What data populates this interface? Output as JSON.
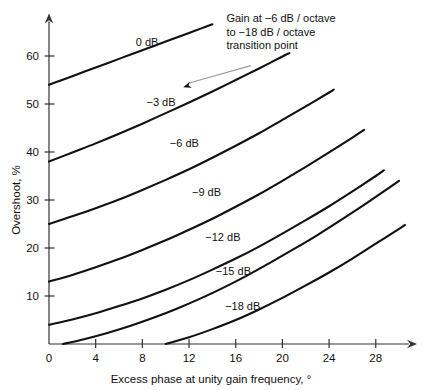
{
  "chart_data": {
    "type": "line",
    "title": "",
    "xlabel": "Excess phase at unity gain frequency, °",
    "ylabel": "Overshoot, %",
    "xlim": [
      0,
      30.5
    ],
    "ylim": [
      0,
      68
    ],
    "grid": false,
    "legend": "inline-curve-labels",
    "xticks": [
      0,
      4,
      8,
      12,
      16,
      20,
      24,
      28
    ],
    "xtick_labels": [
      "0",
      "4",
      "8",
      "12",
      "16",
      "20",
      "24",
      "28"
    ],
    "yticks": [
      10,
      20,
      30,
      40,
      50,
      60
    ],
    "ytick_labels": [
      "10",
      "20",
      "30",
      "40",
      "50",
      "60"
    ],
    "series": [
      {
        "name": "0 dB",
        "label": "0 dB",
        "label_x": 8.4,
        "label_y": 63.0,
        "x": [
          0.0,
          1.0,
          2.0,
          3.0,
          4.0,
          5.0,
          6.0,
          7.0,
          8.0,
          9.0,
          10.0,
          11.0,
          12.0,
          13.0,
          14.0
        ],
        "y": [
          54.0,
          54.9,
          55.8,
          56.7,
          57.6,
          58.5,
          59.4,
          60.3,
          61.2,
          62.1,
          63.0,
          63.9,
          64.8,
          65.7,
          66.6
        ]
      },
      {
        "name": "-3 dB",
        "label": "−3 dB",
        "label_x": 9.6,
        "label_y": 50.5,
        "x": [
          0.0,
          2.0,
          4.0,
          6.0,
          8.0,
          10.0,
          12.0,
          14.0,
          16.0,
          18.0,
          20.0,
          20.6
        ],
        "y": [
          38.0,
          39.9,
          41.8,
          43.8,
          45.9,
          48.1,
          50.3,
          52.6,
          55.0,
          57.4,
          59.9,
          60.6
        ]
      },
      {
        "name": "-6 dB",
        "label": "−6 dB",
        "label_x": 11.6,
        "label_y": 41.8,
        "x": [
          0.0,
          2.0,
          4.0,
          6.0,
          8.0,
          10.0,
          12.0,
          14.0,
          16.0,
          18.0,
          20.0,
          22.0,
          24.0,
          24.4
        ],
        "y": [
          25.0,
          26.6,
          28.3,
          30.1,
          32.1,
          34.2,
          36.4,
          38.8,
          41.3,
          43.9,
          46.7,
          49.5,
          52.4,
          53.0
        ]
      },
      {
        "name": "-9 dB",
        "label": "−9 dB",
        "label_x": 13.5,
        "label_y": 31.6,
        "x": [
          0.0,
          2.0,
          4.0,
          6.0,
          8.0,
          10.0,
          12.0,
          14.0,
          16.0,
          18.0,
          20.0,
          22.0,
          24.0,
          26.0,
          27.0
        ],
        "y": [
          13.0,
          14.4,
          16.0,
          17.7,
          19.6,
          21.6,
          23.8,
          26.1,
          28.6,
          31.2,
          34.0,
          36.9,
          39.9,
          43.0,
          44.6
        ]
      },
      {
        "name": "-12 dB",
        "label": "−12 dB",
        "label_x": 14.9,
        "label_y": 22.2,
        "x": [
          0.0,
          2.0,
          4.0,
          6.0,
          8.0,
          10.0,
          12.0,
          14.0,
          16.0,
          18.0,
          20.0,
          22.0,
          24.0,
          26.0,
          28.0,
          28.7
        ],
        "y": [
          4.0,
          5.1,
          6.4,
          7.9,
          9.5,
          11.3,
          13.3,
          15.5,
          17.8,
          20.3,
          23.0,
          25.8,
          28.7,
          31.8,
          35.0,
          36.2
        ]
      },
      {
        "name": "-15 dB",
        "label": "−15 dB",
        "label_x": 15.8,
        "label_y": 15.2,
        "x": [
          1.2,
          3.0,
          5.0,
          7.0,
          9.0,
          11.0,
          13.0,
          15.0,
          17.0,
          19.0,
          21.0,
          23.0,
          25.0,
          27.0,
          29.0,
          30.0
        ],
        "y": [
          0.0,
          1.0,
          2.3,
          3.8,
          5.5,
          7.4,
          9.5,
          11.8,
          14.3,
          17.0,
          19.8,
          22.7,
          25.8,
          29.0,
          32.3,
          34.0
        ]
      },
      {
        "name": "-18 dB",
        "label": "−18 dB",
        "label_x": 16.6,
        "label_y": 8.0,
        "x": [
          10.0,
          12.0,
          14.0,
          16.0,
          18.0,
          20.0,
          22.0,
          24.0,
          26.0,
          28.0,
          30.0,
          30.5
        ],
        "y": [
          0.0,
          1.4,
          3.1,
          5.0,
          7.2,
          9.6,
          12.2,
          14.9,
          17.8,
          20.9,
          24.0,
          24.8
        ]
      }
    ],
    "annotations": [
      {
        "name": "transition-point-note",
        "lines": [
          "Gain at −6 dB / octave",
          "to −18 dB / octave",
          "transition point"
        ],
        "text_x": 15.2,
        "text_y": 67.0,
        "arrow_from_x": 17.3,
        "arrow_from_y": 58.0,
        "arrow_to_x": 11.5,
        "arrow_to_y": 53.5
      }
    ]
  },
  "axes": {
    "x_title": "Excess phase at unity gain frequency, °",
    "y_title": "Overshoot, %"
  },
  "colors": {
    "curve": "#111111",
    "axis": "#333333",
    "text": "#101010",
    "leader": "#9a9a9a",
    "background": "#ffffff"
  }
}
